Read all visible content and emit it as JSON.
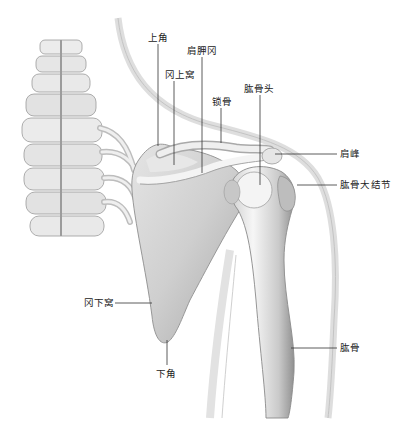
{
  "figure": {
    "background": "#ffffff",
    "colors": {
      "bone_light": "#f2f2f2",
      "bone_mid": "#c9c9c9",
      "bone_dark": "#8f8f8f",
      "outline": "#9a9a9a",
      "body_silhouette": "#e3e3e3",
      "leader_line": "#333333",
      "label_text": "#222222"
    }
  },
  "labels": [
    {
      "id": "superior-angle",
      "text": "上角",
      "x": 148,
      "y": 32,
      "line": {
        "x1": 158,
        "y1": 44,
        "x2": 158,
        "y2": 146
      }
    },
    {
      "id": "scapular-spine",
      "text": "肩胛冈",
      "x": 187,
      "y": 45,
      "line": {
        "x1": 202,
        "y1": 57,
        "x2": 202,
        "y2": 173
      }
    },
    {
      "id": "supraspinous-fossa",
      "text": "冈上窝",
      "x": 165,
      "y": 69,
      "line": {
        "x1": 174,
        "y1": 81,
        "x2": 174,
        "y2": 165
      }
    },
    {
      "id": "clavicle",
      "text": "锁骨",
      "x": 212,
      "y": 96,
      "line": {
        "x1": 221,
        "y1": 108,
        "x2": 221,
        "y2": 143
      }
    },
    {
      "id": "humeral-head",
      "text": "肱骨头",
      "x": 244,
      "y": 83,
      "line": {
        "x1": 260,
        "y1": 95,
        "x2": 260,
        "y2": 185
      }
    },
    {
      "id": "acromion",
      "text": "肩峰",
      "x": 340,
      "y": 148,
      "line": {
        "x1": 275,
        "y1": 154,
        "x2": 337,
        "y2": 154
      }
    },
    {
      "id": "greater-tubercle",
      "text": "肱骨大结节",
      "x": 340,
      "y": 179,
      "line": {
        "x1": 297,
        "y1": 185,
        "x2": 337,
        "y2": 185
      }
    },
    {
      "id": "infraspinous-fossa",
      "text": "冈下窝",
      "x": 84,
      "y": 297,
      "line": {
        "x1": 115,
        "y1": 303,
        "x2": 152,
        "y2": 303
      }
    },
    {
      "id": "inferior-angle",
      "text": "下角",
      "x": 156,
      "y": 368,
      "line": {
        "x1": 167,
        "y1": 340,
        "x2": 167,
        "y2": 365
      }
    },
    {
      "id": "humerus",
      "text": "肱骨",
      "x": 340,
      "y": 342,
      "line": {
        "x1": 291,
        "y1": 348,
        "x2": 337,
        "y2": 348
      }
    }
  ]
}
